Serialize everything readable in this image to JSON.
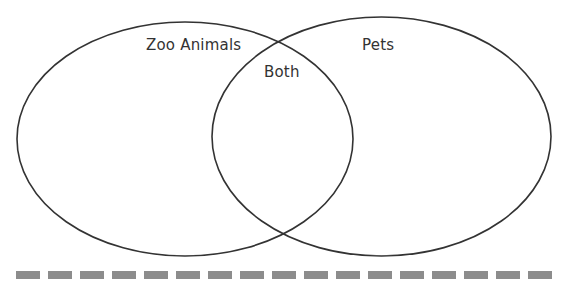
{
  "diagram": {
    "type": "venn",
    "sets": [
      {
        "id": "left",
        "label": "Zoo Animals"
      },
      {
        "id": "right",
        "label": "Pets"
      }
    ],
    "intersection": {
      "label": "Both"
    },
    "stroke_color": "#333333",
    "dash_color": "#8c8c8c",
    "dash_count": 17
  }
}
